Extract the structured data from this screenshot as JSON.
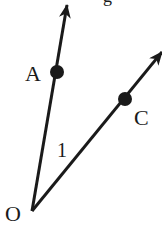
{
  "diagram": {
    "type": "angle-with-rays",
    "colors": {
      "stroke": "#1a1a1a",
      "background": "#ffffff"
    },
    "vertex": {
      "label": "O",
      "x": 32,
      "y": 211,
      "label_x": 5,
      "label_y": 221
    },
    "rays": [
      {
        "name": "OA",
        "tip_x": 67,
        "tip_y": 5,
        "point": {
          "label": "A",
          "x": 57,
          "y": 72,
          "label_x": 25,
          "label_y": 81
        }
      },
      {
        "name": "OC",
        "tip_x": 162,
        "tip_y": 52,
        "point": {
          "label": "C",
          "x": 125,
          "y": 99,
          "label_x": 134,
          "label_y": 125
        }
      }
    ],
    "angle_label": {
      "text": "1",
      "x": 57,
      "y": 157
    },
    "partial_text": {
      "text": "g",
      "x": 103,
      "y": 2
    }
  }
}
